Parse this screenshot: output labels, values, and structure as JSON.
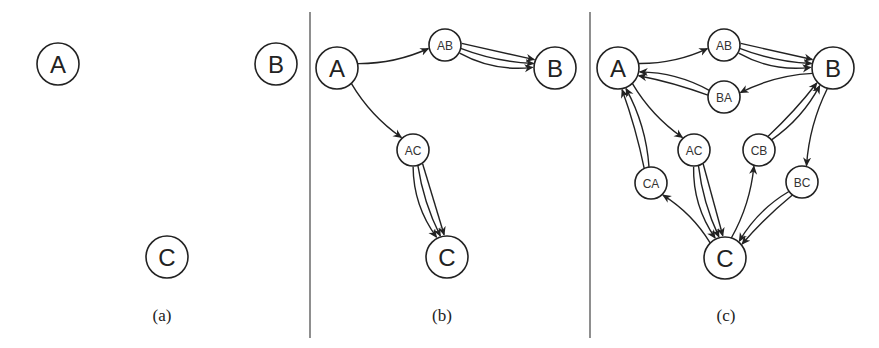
{
  "panels": [
    {
      "caption": "(a)",
      "nodes": [
        {
          "id": "A",
          "label": "A",
          "x": 58,
          "y": 64,
          "r": 21,
          "size": "big"
        },
        {
          "id": "B",
          "label": "B",
          "x": 276,
          "y": 64,
          "r": 21,
          "size": "big"
        },
        {
          "id": "C",
          "label": "C",
          "x": 167,
          "y": 257,
          "r": 21,
          "size": "big"
        }
      ],
      "edges": []
    },
    {
      "caption": "(b)",
      "nodes": [
        {
          "id": "A",
          "label": "A",
          "x": 337,
          "y": 68,
          "r": 21,
          "size": "big"
        },
        {
          "id": "AB",
          "label": "AB",
          "x": 445,
          "y": 45,
          "r": 16,
          "size": "small"
        },
        {
          "id": "B",
          "label": "B",
          "x": 555,
          "y": 68,
          "r": 21,
          "size": "big"
        },
        {
          "id": "AC",
          "label": "AC",
          "x": 413,
          "y": 150,
          "r": 16,
          "size": "small"
        },
        {
          "id": "C",
          "label": "C",
          "x": 447,
          "y": 257,
          "r": 21,
          "size": "big"
        }
      ],
      "edges": [
        {
          "from": "A",
          "to": "AB",
          "count": 1
        },
        {
          "from": "AB",
          "to": "B",
          "count": 3
        },
        {
          "from": "A",
          "to": "AC",
          "count": 1
        },
        {
          "from": "AC",
          "to": "C",
          "count": 3
        }
      ]
    },
    {
      "caption": "(c)",
      "nodes": [
        {
          "id": "A",
          "label": "A",
          "x": 618,
          "y": 68,
          "r": 21,
          "size": "big"
        },
        {
          "id": "AB",
          "label": "AB",
          "x": 724,
          "y": 45,
          "r": 16,
          "size": "small"
        },
        {
          "id": "B",
          "label": "B",
          "x": 833,
          "y": 68,
          "r": 21,
          "size": "big"
        },
        {
          "id": "BA",
          "label": "BA",
          "x": 724,
          "y": 97,
          "r": 16,
          "size": "small"
        },
        {
          "id": "AC",
          "label": "AC",
          "x": 694,
          "y": 150,
          "r": 16,
          "size": "small"
        },
        {
          "id": "CB",
          "label": "CB",
          "x": 759,
          "y": 150,
          "r": 16,
          "size": "small"
        },
        {
          "id": "CA",
          "label": "CA",
          "x": 651,
          "y": 183,
          "r": 16,
          "size": "small"
        },
        {
          "id": "BC",
          "label": "BC",
          "x": 802,
          "y": 182,
          "r": 16,
          "size": "small"
        },
        {
          "id": "C",
          "label": "C",
          "x": 725,
          "y": 258,
          "r": 21,
          "size": "big"
        }
      ],
      "edges": [
        {
          "from": "A",
          "to": "AB",
          "count": 1
        },
        {
          "from": "AB",
          "to": "B",
          "count": 3
        },
        {
          "from": "B",
          "to": "BA",
          "count": 1
        },
        {
          "from": "BA",
          "to": "A",
          "count": 2
        },
        {
          "from": "A",
          "to": "AC",
          "count": 1
        },
        {
          "from": "AC",
          "to": "C",
          "count": 3
        },
        {
          "from": "C",
          "to": "CB",
          "count": 1
        },
        {
          "from": "CB",
          "to": "B",
          "count": 2
        },
        {
          "from": "B",
          "to": "BC",
          "count": 1
        },
        {
          "from": "BC",
          "to": "C",
          "count": 2
        },
        {
          "from": "C",
          "to": "CA",
          "count": 1
        },
        {
          "from": "CA",
          "to": "A",
          "count": 2
        }
      ]
    }
  ],
  "dividers": [
    310,
    590
  ],
  "captions": {
    "a": "(a)",
    "b": "(b)",
    "c": "(c)"
  }
}
